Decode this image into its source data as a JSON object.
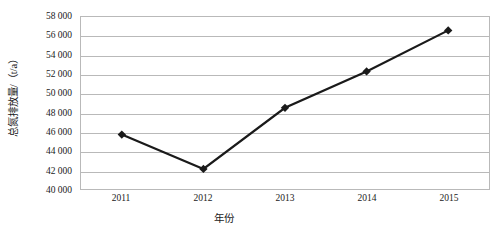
{
  "chart_data": {
    "type": "line",
    "title": "",
    "subtitle": "",
    "xlabel": "年份",
    "ylabel": "总氮排放量/（t/a）",
    "categories": [
      "2011",
      "2012",
      "2013",
      "2014",
      "2015"
    ],
    "values": [
      45700,
      42100,
      48500,
      52300,
      56600
    ],
    "series": [
      {
        "name": "总氮排放量",
        "values": [
          45700,
          42100,
          48500,
          52300,
          56600
        ],
        "color": "#1a1a1a",
        "marker": "diamond",
        "line_width": 2.2
      }
    ],
    "ylim": [
      40000,
      58000
    ],
    "ytick_step": 2000,
    "ytick_labels": [
      "58 000",
      "56 000",
      "54 000",
      "52 000",
      "50 000",
      "48 000",
      "46 000",
      "44 000",
      "42 000",
      "40 000"
    ],
    "ytick_values": [
      58000,
      56000,
      54000,
      52000,
      50000,
      48000,
      46000,
      44000,
      42000,
      40000
    ],
    "xtick_labels": [
      "2011",
      "2012",
      "2013",
      "2014",
      "2015"
    ],
    "grid": {
      "horizontal": true,
      "vertical": false,
      "color": "#b9b9b9"
    },
    "legend": {
      "visible": false,
      "position": "none",
      "entries": []
    },
    "plot_border": {
      "visible": true,
      "color": "#b9b9b9"
    },
    "annotations": []
  },
  "colors": {
    "background": "#ffffff",
    "axis_text": "#1a1a1a",
    "grid": "#b9b9b9",
    "series_line": "#1a1a1a",
    "series_marker": "#1a1a1a"
  }
}
